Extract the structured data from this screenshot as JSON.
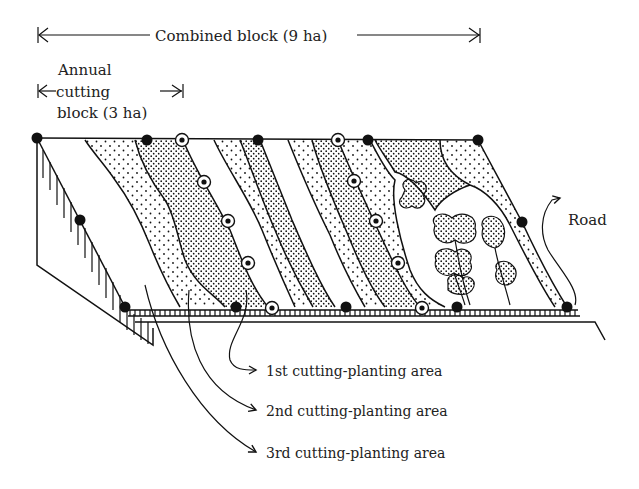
{
  "labels": {
    "combined_block": "Combined block (9 ha)",
    "annual_line1": "Annual",
    "annual_line2": "cutting",
    "annual_line3": "block (3 ha)",
    "road": "Road",
    "area_1": "1st cutting-planting area",
    "area_2": "2nd cutting-planting area",
    "area_3": "3rd cutting-planting area"
  },
  "colors": {
    "ink": "#111111",
    "background": "#ffffff"
  },
  "legend_items": [
    {
      "label": "1st cutting-planting area",
      "pattern": "dense-dots"
    },
    {
      "label": "2nd cutting-planting area",
      "pattern": "sparse-dots"
    },
    {
      "label": "3rd cutting-planting area",
      "pattern": "blank"
    }
  ],
  "markers": {
    "solid_dots": [
      [
        37,
        138
      ],
      [
        147,
        140
      ],
      [
        258,
        140
      ],
      [
        368,
        140
      ],
      [
        478,
        140
      ],
      [
        80,
        220
      ],
      [
        125,
        307
      ],
      [
        236,
        307
      ],
      [
        346,
        307
      ],
      [
        457,
        307
      ],
      [
        567,
        307
      ],
      [
        522,
        222
      ]
    ],
    "ring_dots": [
      [
        182,
        140
      ],
      [
        338,
        140
      ],
      [
        204,
        182
      ],
      [
        228,
        221
      ],
      [
        248,
        263
      ],
      [
        272,
        308
      ],
      [
        354,
        181
      ],
      [
        376,
        221
      ],
      [
        398,
        263
      ],
      [
        422,
        308
      ]
    ]
  }
}
